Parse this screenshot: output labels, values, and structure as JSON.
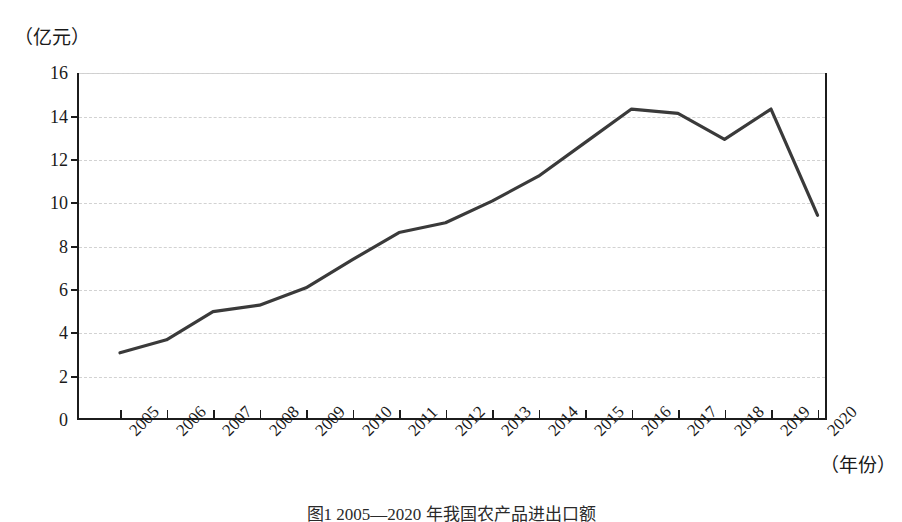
{
  "figure": {
    "caption": "图1   2005—2020 年我国农产品进出口额",
    "y_axis": {
      "unit_label": "（亿元）",
      "ticks": [
        0,
        2,
        4,
        6,
        8,
        10,
        12,
        14,
        16
      ],
      "min": 0,
      "max": 16
    },
    "x_axis": {
      "unit_label": "（年份）",
      "ticks": [
        "2005",
        "2006",
        "2007",
        "2008",
        "2009",
        "2010",
        "2011",
        "2012",
        "2013",
        "2014",
        "2015",
        "2016",
        "2017",
        "2018",
        "2019",
        "2020"
      ]
    },
    "line_color": "#3a3a3a"
  },
  "chart_data": {
    "type": "line",
    "title": "图1   2005—2020 年我国农产品进出口额",
    "xlabel": "（年份）",
    "ylabel": "（亿元）",
    "categories": [
      "2005",
      "2006",
      "2007",
      "2008",
      "2009",
      "2010",
      "2011",
      "2012",
      "2013",
      "2014",
      "2015",
      "2016",
      "2017",
      "2018",
      "2019",
      "2020"
    ],
    "values": [
      3.1,
      3.7,
      5.0,
      5.3,
      6.1,
      7.4,
      8.65,
      9.1,
      10.1,
      11.25,
      12.8,
      14.35,
      14.15,
      12.95,
      14.35,
      9.45
    ],
    "ylim": [
      0,
      16
    ],
    "ytick_step": 2,
    "grid": true,
    "legend": "none",
    "series": [
      {
        "name": "农产品进出口额",
        "values": [
          3.1,
          3.7,
          5.0,
          5.3,
          6.1,
          7.4,
          8.65,
          9.1,
          10.1,
          11.25,
          12.8,
          14.35,
          14.15,
          12.95,
          14.35,
          9.45
        ]
      }
    ]
  }
}
